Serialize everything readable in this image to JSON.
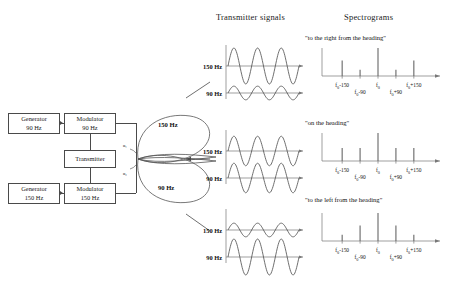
{
  "headers": {
    "transmitter_signals": "Transmitter signals",
    "spectrograms": "Spectrograms"
  },
  "block_diagram": {
    "blocks": [
      {
        "id": "generator_90",
        "line1": "Generator",
        "line2": "90 Hz"
      },
      {
        "id": "modulator_90",
        "line1": "Modulator",
        "line2": "90 Hz"
      },
      {
        "id": "transmitter",
        "line1": "Transmitter",
        "line2": ""
      },
      {
        "id": "generator_150",
        "line1": "Generator",
        "line2": "150 Hz"
      },
      {
        "id": "modulator_150",
        "line1": "Modulator",
        "line2": "150 Hz"
      }
    ],
    "angle_labels": [
      "α₁",
      "α₂"
    ]
  },
  "antenna_pattern": {
    "upper_lobe_label": "150 Hz",
    "lower_lobe_label": "90 Hz"
  },
  "signal_groups": [
    {
      "id": "right-of-heading",
      "upper_label": "150 Hz",
      "lower_label": "90 Hz",
      "upper_amplitude": 1.0,
      "lower_amplitude": 0.38
    },
    {
      "id": "on-heading",
      "upper_label": "150 Hz",
      "lower_label": "90 Hz",
      "upper_amplitude": 0.82,
      "lower_amplitude": 0.82
    },
    {
      "id": "left-of-heading",
      "upper_label": "150 Hz",
      "lower_label": "90 Hz",
      "upper_amplitude": 0.38,
      "lower_amplitude": 1.0
    }
  ],
  "spectrograms": [
    {
      "id": "spec-right",
      "caption": "\"to the right from the heading\"",
      "ticks": [
        {
          "label": "f₀-150",
          "sub": "0",
          "text_main": "f",
          "text_rest": "-150",
          "row": 0,
          "pos": 0.18
        },
        {
          "label": "f₀-90",
          "sub": "0",
          "text_main": "f",
          "text_rest": "-90",
          "row": 1,
          "pos": 0.34
        },
        {
          "label": "f₀",
          "sub": "0",
          "text_main": "f",
          "text_rest": "",
          "row": 0,
          "pos": 0.5
        },
        {
          "label": "f₀+90",
          "sub": "0",
          "text_main": "f",
          "text_rest": "+90",
          "row": 1,
          "pos": 0.66
        },
        {
          "label": "f₀+150",
          "sub": "0",
          "text_main": "f",
          "text_rest": "+150",
          "row": 0,
          "pos": 0.82
        }
      ],
      "lines": [
        {
          "pos": 0.18,
          "height": 0.55
        },
        {
          "pos": 0.34,
          "height": 0.22
        },
        {
          "pos": 0.5,
          "height": 1.0
        },
        {
          "pos": 0.66,
          "height": 0.22
        },
        {
          "pos": 0.82,
          "height": 0.55
        }
      ]
    },
    {
      "id": "spec-center",
      "caption": "\"on the heading\"",
      "ticks": [
        {
          "label": "f₀-150",
          "sub": "0",
          "text_main": "f",
          "text_rest": "-150",
          "row": 0,
          "pos": 0.18
        },
        {
          "label": "f₀-90",
          "sub": "0",
          "text_main": "f",
          "text_rest": "-90",
          "row": 1,
          "pos": 0.34
        },
        {
          "label": "f₀",
          "sub": "0",
          "text_main": "f",
          "text_rest": "",
          "row": 0,
          "pos": 0.5
        },
        {
          "label": "f₀+90",
          "sub": "0",
          "text_main": "f",
          "text_rest": "+90",
          "row": 1,
          "pos": 0.66
        },
        {
          "label": "f₀+150",
          "sub": "0",
          "text_main": "f",
          "text_rest": "+150",
          "row": 0,
          "pos": 0.82
        }
      ],
      "lines": [
        {
          "pos": 0.18,
          "height": 0.46
        },
        {
          "pos": 0.34,
          "height": 0.46
        },
        {
          "pos": 0.5,
          "height": 1.0
        },
        {
          "pos": 0.66,
          "height": 0.46
        },
        {
          "pos": 0.82,
          "height": 0.46
        }
      ]
    },
    {
      "id": "spec-left",
      "caption": "\"to the left from the heading\"",
      "ticks": [
        {
          "label": "f₀-150",
          "sub": "0",
          "text_main": "f",
          "text_rest": "-150",
          "row": 0,
          "pos": 0.18
        },
        {
          "label": "f₀-90",
          "sub": "0",
          "text_main": "f",
          "text_rest": "-90",
          "row": 1,
          "pos": 0.34
        },
        {
          "label": "f₀",
          "sub": "0",
          "text_main": "f",
          "text_rest": "",
          "row": 0,
          "pos": 0.5
        },
        {
          "label": "f₀+90",
          "sub": "0",
          "text_main": "f",
          "text_rest": "+90",
          "row": 1,
          "pos": 0.66
        },
        {
          "label": "f₀+150",
          "sub": "0",
          "text_main": "f",
          "text_rest": "+150",
          "row": 0,
          "pos": 0.82
        }
      ],
      "lines": [
        {
          "pos": 0.18,
          "height": 0.22
        },
        {
          "pos": 0.34,
          "height": 0.55
        },
        {
          "pos": 0.5,
          "height": 1.0
        },
        {
          "pos": 0.66,
          "height": 0.55
        },
        {
          "pos": 0.82,
          "height": 0.22
        }
      ]
    }
  ],
  "colors": {
    "stroke": "#4a4a4a",
    "wave": "#555555",
    "text": "#1a1a1a",
    "background": "#ffffff"
  }
}
